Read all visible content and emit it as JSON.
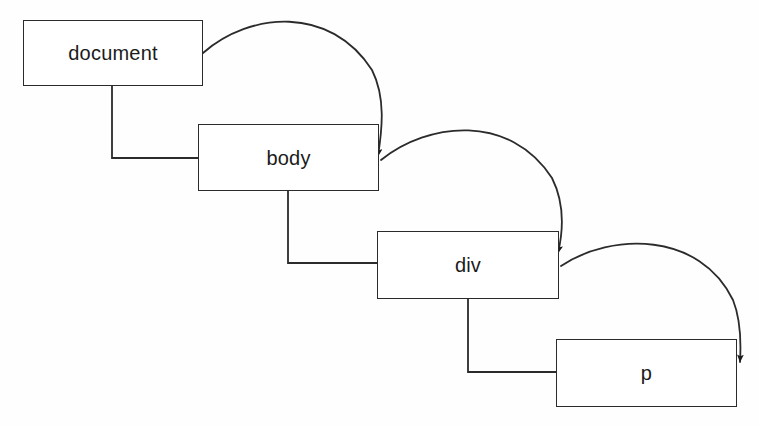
{
  "diagram": {
    "type": "node-tree",
    "background_color": "#fefefe",
    "line_color": "#2b2b2b",
    "text_color": "#1b1b1b",
    "nodes": [
      {
        "id": "document",
        "label": "document",
        "x": 23,
        "y": 20,
        "width": 180,
        "height": 66
      },
      {
        "id": "body",
        "label": "body",
        "x": 198,
        "y": 124,
        "width": 181,
        "height": 67
      },
      {
        "id": "div",
        "label": "div",
        "x": 377,
        "y": 231,
        "width": 182,
        "height": 68
      },
      {
        "id": "p",
        "label": "p",
        "x": 556,
        "y": 339,
        "width": 181,
        "height": 68
      }
    ],
    "connectors": [
      {
        "id": "document-to-body-elbow",
        "style": "orthogonal-elbow",
        "from": "document",
        "to": "body",
        "path": "M 112 86 L 112 158 L 198 158"
      },
      {
        "id": "document-to-body-curve",
        "style": "curved-arrow",
        "from": "document",
        "to": "body",
        "path": "M 203 53 C 250 12, 330 5, 372 70 C 386 98, 382 130, 378 156"
      },
      {
        "id": "body-to-div-elbow",
        "style": "orthogonal-elbow",
        "from": "body",
        "to": "div",
        "path": "M 288 191 L 288 263 L 377 263"
      },
      {
        "id": "body-to-div-curve",
        "style": "curved-arrow",
        "from": "body",
        "to": "div",
        "path": "M 381 160 C 428 122, 510 113, 552 178 C 566 206, 562 236, 558 253"
      },
      {
        "id": "div-to-p-elbow",
        "style": "orthogonal-elbow",
        "from": "div",
        "to": "p",
        "path": "M 468 299 L 468 372 L 556 372"
      },
      {
        "id": "div-to-p-curve",
        "style": "curved-arrow",
        "from": "div",
        "to": "p",
        "path": "M 561 266 C 612 232, 700 232, 733 300 C 741 320, 741 345, 740 362"
      }
    ],
    "arrowheads": [
      {
        "id": "arrow-into-body",
        "x": 378,
        "y": 160
      },
      {
        "id": "arrow-into-div",
        "x": 558,
        "y": 257
      },
      {
        "id": "arrow-into-p",
        "x": 740,
        "y": 368
      }
    ]
  }
}
